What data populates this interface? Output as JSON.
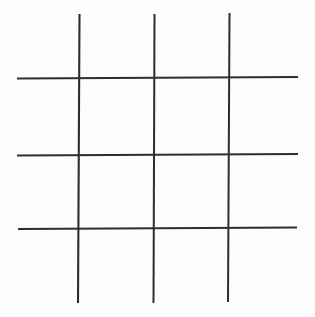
{
  "figure": {
    "name": "hash-grid",
    "canvas": {
      "width": 315,
      "height": 317,
      "background_color": "#fdfdfd"
    },
    "style": {
      "line_color": "#2e2e2e",
      "line_width": 2,
      "line_cap": "butt",
      "cell_count": 9,
      "row_count": 3,
      "column_count": 3
    },
    "lines": [
      {
        "id": "vertical-1",
        "orientation": "vertical",
        "label": "Left vertical line",
        "x1": 79.5,
        "y1": 14,
        "x2": 78.0,
        "y2": 303,
        "color": "#2e2e2e",
        "width": 2.1
      },
      {
        "id": "vertical-2",
        "orientation": "vertical",
        "label": "Middle vertical line",
        "x1": 154.5,
        "y1": 14,
        "x2": 153.5,
        "y2": 303,
        "color": "#2e2e2e",
        "width": 2.0
      },
      {
        "id": "vertical-3",
        "orientation": "vertical",
        "label": "Right vertical line",
        "x1": 229.5,
        "y1": 13,
        "x2": 228.0,
        "y2": 302,
        "color": "#2e2e2e",
        "width": 2.0
      },
      {
        "id": "horizontal-1",
        "orientation": "horizontal",
        "label": "Top horizontal line",
        "x1": 17,
        "y1": 78.5,
        "x2": 298,
        "y2": 77.0,
        "color": "#2e2e2e",
        "width": 2.0
      },
      {
        "id": "horizontal-2",
        "orientation": "horizontal",
        "label": "Middle horizontal line",
        "x1": 17,
        "y1": 155.5,
        "x2": 298,
        "y2": 154.0,
        "color": "#2e2e2e",
        "width": 2.0
      },
      {
        "id": "horizontal-3",
        "orientation": "horizontal",
        "label": "Bottom horizontal line",
        "x1": 18,
        "y1": 229.0,
        "x2": 297,
        "y2": 227.5,
        "color": "#2e2e2e",
        "width": 2.0
      }
    ],
    "intersections": [
      {
        "id": "i-1-1",
        "x": 79,
        "y": 78
      },
      {
        "id": "i-1-2",
        "x": 154,
        "y": 78
      },
      {
        "id": "i-1-3",
        "x": 229,
        "y": 77
      },
      {
        "id": "i-2-1",
        "x": 79,
        "y": 155
      },
      {
        "id": "i-2-2",
        "x": 154,
        "y": 155
      },
      {
        "id": "i-2-3",
        "x": 229,
        "y": 154
      },
      {
        "id": "i-3-1",
        "x": 79,
        "y": 228
      },
      {
        "id": "i-3-2",
        "x": 154,
        "y": 228
      },
      {
        "id": "i-3-3",
        "x": 229,
        "y": 228
      }
    ],
    "cells": [
      {
        "id": "cell-r1c1",
        "label": "top-left",
        "mark": ""
      },
      {
        "id": "cell-r1c2",
        "label": "top-center",
        "mark": ""
      },
      {
        "id": "cell-r1c3",
        "label": "top-right",
        "mark": ""
      },
      {
        "id": "cell-r2c1",
        "label": "middle-left",
        "mark": ""
      },
      {
        "id": "cell-r2c2",
        "label": "middle-center",
        "mark": ""
      },
      {
        "id": "cell-r2c3",
        "label": "middle-right",
        "mark": ""
      },
      {
        "id": "cell-r3c1",
        "label": "bottom-left",
        "mark": ""
      },
      {
        "id": "cell-r3c2",
        "label": "bottom-center",
        "mark": ""
      },
      {
        "id": "cell-r3c3",
        "label": "bottom-right",
        "mark": ""
      }
    ]
  }
}
